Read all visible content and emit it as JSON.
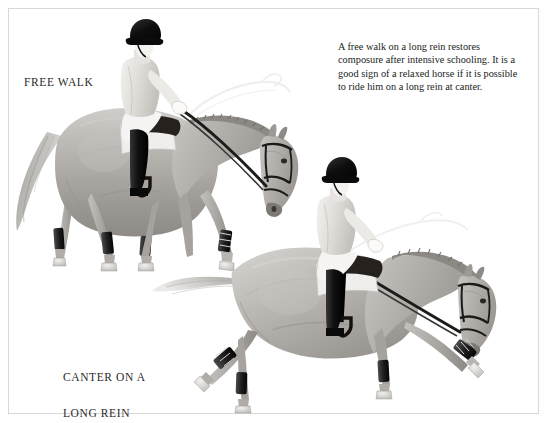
{
  "page": {
    "background_color": "#ffffff",
    "border_color": "#d8d8d8"
  },
  "caption": {
    "text": "A free walk on a long rein restores composure after intensive schooling. It is a good sign of a relaxed horse if it is possible to ride him on a long rein at canter."
  },
  "labels": {
    "free_walk": "FREE WALK",
    "canter_line1": "CANTER ON A",
    "canter_line2": "LONG REIN"
  },
  "illustration": {
    "medium": "grayscale pencil drawing",
    "figures": [
      {
        "name": "horse-and-rider-free-walk",
        "gait": "free walk",
        "description": "Horse walking to the right with head and neck stretched low and forward on a long rein; rider seated in light jacket, black helmet, white breeches and black boots.",
        "horse_coat_color": "#b9b6b2",
        "helmet_color": "#0d0d0d",
        "jacket_color": "#e9e7e4",
        "boot_color": "#171717",
        "leg_wrap_color": "#2a2a2a"
      },
      {
        "name": "horse-and-rider-canter",
        "gait": "canter on a long rein",
        "description": "Horse cantering to the right with foreleg extended and tail streaming; rider seated in light jacket, black helmet, white breeches and black boots.",
        "horse_coat_color": "#b9b6b2",
        "helmet_color": "#0d0d0d",
        "jacket_color": "#e9e7e4",
        "boot_color": "#171717",
        "leg_wrap_color": "#2a2a2a"
      }
    ]
  }
}
